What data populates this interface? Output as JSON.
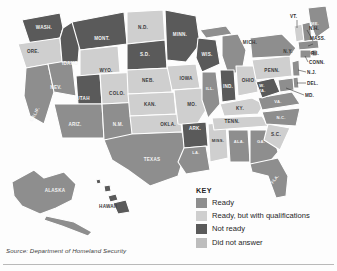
{
  "figure": {
    "source_note": "Source: Department of Homeland Security"
  },
  "key": {
    "title": "KEY",
    "entries": [
      {
        "label": "Ready",
        "color": "#8e8e8e"
      },
      {
        "label": "Ready, but with qualifications",
        "color": "#cfcfcf"
      },
      {
        "label": "Not ready",
        "color": "#5a5a5a"
      },
      {
        "label": "Did not answer",
        "color": "#bdbdbd"
      }
    ]
  },
  "colors": {
    "ready": "#8e8e8e",
    "ready_qualified": "#cfcfcf",
    "not_ready": "#5a5a5a",
    "no_answer": "#bdbdbd",
    "water": "#ffffff",
    "border": "#ffffff"
  },
  "map": {
    "type": "choropleth",
    "region": "United States",
    "inset_labels": [
      "ALASKA",
      "HAWAII"
    ],
    "states": [
      {
        "label": "WASH.",
        "status": "Not ready"
      },
      {
        "label": "ORE.",
        "status": "Ready, but with qualifications"
      },
      {
        "label": "IDAHO",
        "status": "Not ready"
      },
      {
        "label": "MONT.",
        "status": "Not ready"
      },
      {
        "label": "WYO.",
        "status": "Ready, but with qualifications"
      },
      {
        "label": "NEV.",
        "status": "Ready"
      },
      {
        "label": "UTAH",
        "status": "Not ready"
      },
      {
        "label": "CALIF.",
        "status": "Ready"
      },
      {
        "label": "ARIZ.",
        "status": "Ready"
      },
      {
        "label": "COLO.",
        "status": "Ready, but with qualifications"
      },
      {
        "label": "N.M.",
        "status": "Ready"
      },
      {
        "label": "N.D.",
        "status": "Ready, but with qualifications"
      },
      {
        "label": "S.D.",
        "status": "Not ready"
      },
      {
        "label": "NEB.",
        "status": "Ready, but with qualifications"
      },
      {
        "label": "KAN.",
        "status": "Ready, but with qualifications"
      },
      {
        "label": "OKLA.",
        "status": "Ready, but with qualifications"
      },
      {
        "label": "TEXAS",
        "status": "Ready"
      },
      {
        "label": "MINN.",
        "status": "Not ready"
      },
      {
        "label": "IOWA",
        "status": "Ready, but with qualifications"
      },
      {
        "label": "MO.",
        "status": "Ready, but with qualifications"
      },
      {
        "label": "ARK.",
        "status": "Not ready"
      },
      {
        "label": "LA.",
        "status": "Ready"
      },
      {
        "label": "WIS.",
        "status": "Not ready"
      },
      {
        "label": "ILL.",
        "status": "Ready"
      },
      {
        "label": "MISS.",
        "status": "Ready, but with qualifications"
      },
      {
        "label": "MICH.",
        "status": "Ready"
      },
      {
        "label": "IND.",
        "status": "Not ready"
      },
      {
        "label": "OHIO",
        "status": "Ready, but with qualifications"
      },
      {
        "label": "KY.",
        "status": "Ready, but with qualifications"
      },
      {
        "label": "TENN.",
        "status": "Ready, but with qualifications"
      },
      {
        "label": "ALA.",
        "status": "Ready"
      },
      {
        "label": "GA.",
        "status": "Ready"
      },
      {
        "label": "FLA.",
        "status": "Ready"
      },
      {
        "label": "S.C.",
        "status": "Ready, but with qualifications"
      },
      {
        "label": "N.C.",
        "status": "Ready"
      },
      {
        "label": "VA.",
        "status": "Ready"
      },
      {
        "label": "W.VA.",
        "status": "Not ready"
      },
      {
        "label": "PENN.",
        "status": "Ready, but with qualifications"
      },
      {
        "label": "N.Y.",
        "status": "Ready"
      },
      {
        "label": "VT.",
        "status": "Ready, but with qualifications"
      },
      {
        "label": "ME.",
        "status": "Ready"
      },
      {
        "label": "N.H.",
        "status": "Ready"
      },
      {
        "label": "MASS.",
        "status": "Ready"
      },
      {
        "label": "R.I.",
        "status": "Ready"
      },
      {
        "label": "CONN.",
        "status": "Ready"
      },
      {
        "label": "N.J.",
        "status": "Ready"
      },
      {
        "label": "DEL.",
        "status": "Ready"
      },
      {
        "label": "MD.",
        "status": "Ready"
      },
      {
        "label": "ALASKA",
        "status": "Ready"
      },
      {
        "label": "HAWAII",
        "status": "Not ready"
      }
    ],
    "leader_labels": [
      "VT.",
      "N.H.",
      "MASS.",
      "R.I.",
      "CONN.",
      "N.J.",
      "DEL.",
      "MD.",
      "MICH."
    ]
  }
}
